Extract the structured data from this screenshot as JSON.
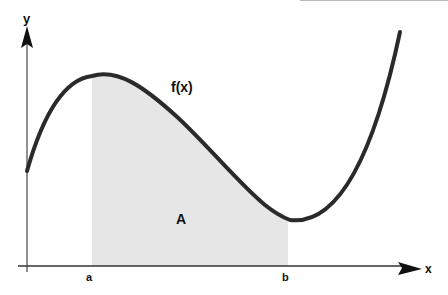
{
  "diagram": {
    "axes": {
      "x_label": "x",
      "y_label": "y"
    },
    "function_label": "f(x)",
    "area_label": "A",
    "bounds": {
      "lower": "a",
      "upper": "b"
    },
    "colors": {
      "curve": "#2a2a2a",
      "shade": "#e6e6e6",
      "axis": "#333333"
    }
  }
}
